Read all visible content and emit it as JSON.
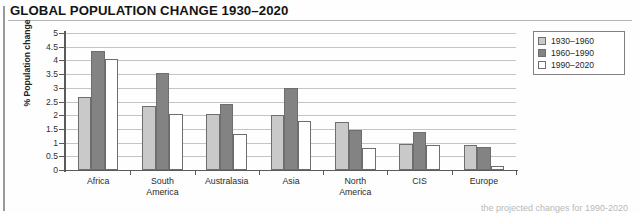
{
  "header": {
    "title": "GLOBAL POPULATION CHANGE 1930–2020"
  },
  "caption": {
    "text": "the projected changes for 1990-2020"
  },
  "colors": {
    "series_1930_1960": "#c9c9c9",
    "series_1960_1990": "#838383",
    "series_1990_2020": "#ffffff",
    "axis": "#5a5a5a",
    "gridline": "#c4c4c4",
    "bar_outline": "#6e6e6e"
  },
  "chart_data": {
    "type": "bar",
    "title": "GLOBAL POPULATION CHANGE 1930–2020",
    "xlabel": "",
    "ylabel": "% Population change",
    "ylim": [
      0,
      5
    ],
    "ytick_values": [
      0,
      0.5,
      1,
      1.5,
      2,
      2.5,
      3,
      3.5,
      4,
      4.5,
      5
    ],
    "ytick_labels": [
      "0",
      "0.5",
      "1",
      "1.5",
      "2",
      "2.5",
      "3",
      "3.5",
      "4",
      "4.5",
      "5"
    ],
    "grid": true,
    "legend_position": "top-right",
    "categories": [
      "Africa",
      "South\nAmerica",
      "Australasia",
      "Asia",
      "North\nAmerica",
      "CIS",
      "Europe"
    ],
    "series": [
      {
        "name": "1930–1960",
        "color": "#c9c9c9",
        "values": [
          2.65,
          2.35,
          2.05,
          2.0,
          1.75,
          0.95,
          0.9
        ]
      },
      {
        "name": "1960–1990",
        "color": "#838383",
        "values": [
          4.35,
          3.55,
          2.4,
          3.0,
          1.45,
          1.4,
          0.85
        ]
      },
      {
        "name": "1990–2020",
        "color": "#ffffff",
        "values": [
          4.05,
          2.05,
          1.3,
          1.8,
          0.8,
          0.9,
          0.15
        ]
      }
    ]
  }
}
